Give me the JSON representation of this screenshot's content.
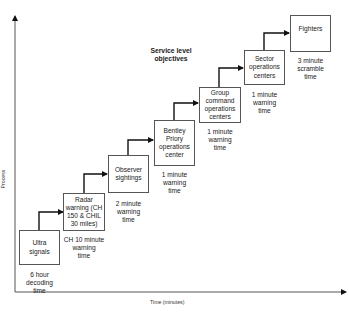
{
  "diagram": {
    "title": "Service level\nobjectives",
    "axes": {
      "y_label": "Process",
      "x_label": "Time (minutes)"
    },
    "steps": [
      {
        "label": "Ultra\nsignals",
        "caption": "6 hour\ndecoding\ntime"
      },
      {
        "label": "Radar\nwarning (CH\n150 & CHIL\n30 miles)",
        "caption": "CH 10 minute\nwarning\ntime"
      },
      {
        "label": "Observer\nsightings",
        "caption": "2 minute\nwarning\ntime"
      },
      {
        "label": "Bentley\nPriory\noperations\ncenter",
        "caption": "1 minute\nwarning\ntime"
      },
      {
        "label": "Group\ncommand\noperations\ncenters",
        "caption": "1 minute\nwarning\ntime"
      },
      {
        "label": "Sector\noperations\ncenters",
        "caption": "1 minute\nwarning\ntime"
      },
      {
        "label": "Fighters",
        "caption": "3 minute\nscramble\ntime"
      }
    ]
  }
}
